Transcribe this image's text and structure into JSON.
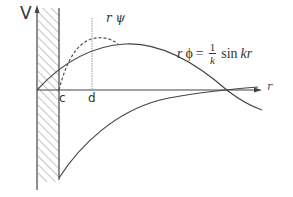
{
  "diagram": {
    "type": "physics-potential-wavefunction",
    "labels": {
      "y_axis": "V",
      "x_axis": "r",
      "hard_core_radius": "c",
      "range": "d",
      "wavefunction_label": "r ψ",
      "equation": {
        "lhs_var": "r",
        "lhs_func": "ϕ",
        "equals": "=",
        "numerator": "1",
        "denominator": "k",
        "rhs": "sin",
        "rhs_arg": "kr"
      }
    },
    "elements": [
      {
        "name": "hard-core-region",
        "style": "hatched",
        "x_range": [
          "0",
          "c"
        ]
      },
      {
        "name": "free-wave-curve",
        "label": "rϕ = (1/k) sin kr",
        "style": "solid"
      },
      {
        "name": "interacting-wavefunction-curve",
        "label": "rψ",
        "style": "dashed"
      },
      {
        "name": "attractive-potential-curve",
        "style": "solid",
        "region": "r > c, V < 0"
      },
      {
        "name": "range-marker",
        "label": "d",
        "style": "dotted-vertical"
      }
    ],
    "colors": {
      "stroke": "#444444",
      "hatch": "#888888",
      "guide": "#999999",
      "text": "#333333"
    }
  }
}
